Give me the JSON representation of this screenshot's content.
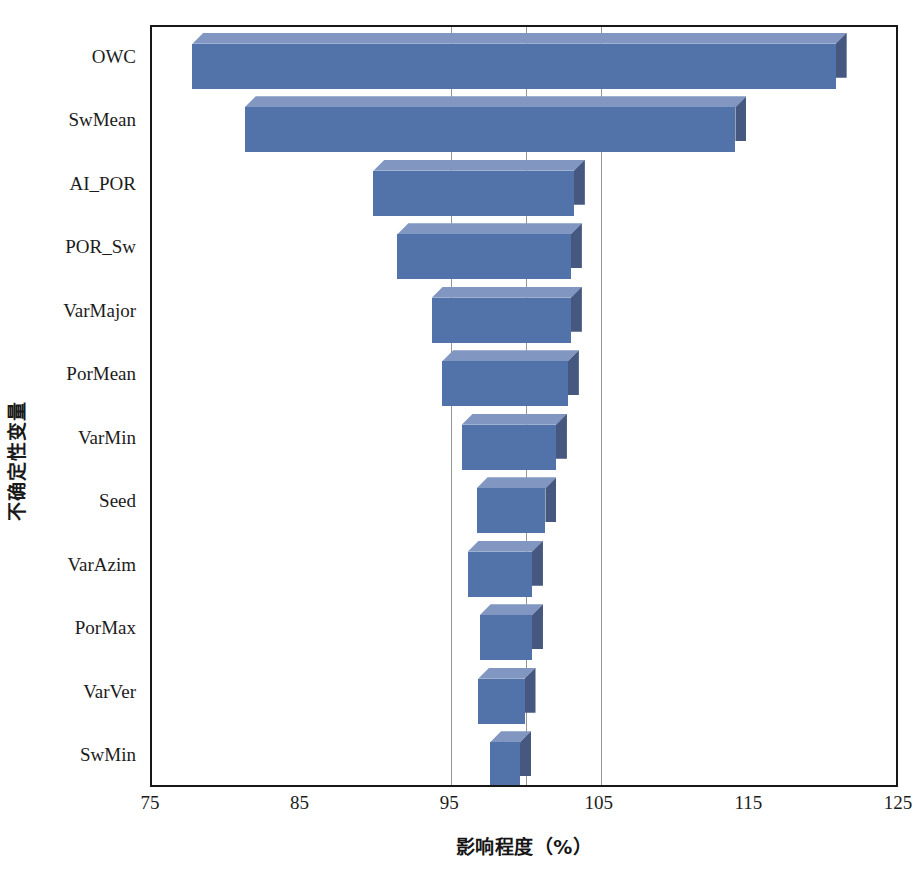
{
  "chart_data": {
    "type": "bar",
    "subtype": "tornado",
    "title": "",
    "xlabel": "影响程度（%）",
    "ylabel": "不确定性变量",
    "xlim": [
      75,
      125
    ],
    "xticks": [
      75,
      85,
      95,
      105,
      115,
      125
    ],
    "xtick_labels": [
      "75",
      "85",
      "95",
      "105",
      "115",
      "125"
    ],
    "gridlines": [
      95,
      100,
      105
    ],
    "grid": true,
    "legend": null,
    "orientation": "horizontal",
    "base_value": 100,
    "categories": [
      "OWC",
      "SwMean",
      "AI_POR",
      "POR_Sw",
      "VarMajor",
      "PorMean",
      "VarMin",
      "Seed",
      "VarAzim",
      "PorMax",
      "VarVer",
      "SwMin"
    ],
    "low": [
      77.7,
      81.2,
      89.8,
      91.4,
      93.7,
      94.4,
      95.7,
      96.7,
      96.1,
      96.9,
      96.8,
      97.6
    ],
    "high": [
      120.7,
      114.0,
      103.2,
      103.0,
      103.0,
      102.8,
      102.0,
      101.3,
      100.4,
      100.4,
      99.9,
      99.6
    ],
    "bars": [
      {
        "category": "OWC",
        "low": 77.7,
        "high": 120.7,
        "range": 43.0
      },
      {
        "category": "SwMean",
        "low": 81.2,
        "high": 114.0,
        "range": 32.8
      },
      {
        "category": "AI_POR",
        "low": 89.8,
        "high": 103.2,
        "range": 13.4
      },
      {
        "category": "POR_Sw",
        "low": 91.4,
        "high": 103.0,
        "range": 11.6
      },
      {
        "category": "VarMajor",
        "low": 93.7,
        "high": 103.0,
        "range": 9.3
      },
      {
        "category": "PorMean",
        "low": 94.4,
        "high": 102.8,
        "range": 8.4
      },
      {
        "category": "VarMin",
        "low": 95.7,
        "high": 102.0,
        "range": 6.3
      },
      {
        "category": "Seed",
        "low": 96.7,
        "high": 101.3,
        "range": 4.6
      },
      {
        "category": "VarAzim",
        "low": 96.1,
        "high": 100.4,
        "range": 4.3
      },
      {
        "category": "PorMax",
        "low": 96.9,
        "high": 100.4,
        "range": 3.5
      },
      {
        "category": "VarVer",
        "low": 96.8,
        "high": 99.9,
        "range": 3.1
      },
      {
        "category": "SwMin",
        "low": 97.6,
        "high": 99.6,
        "range": 2.0
      }
    ],
    "colors": {
      "bar_front": "#5273a9",
      "bar_top": "#8197c2",
      "bar_side": "#46587f",
      "frame": "#171717",
      "gridline": "#6e6e6e",
      "background": "#ffffff"
    }
  }
}
